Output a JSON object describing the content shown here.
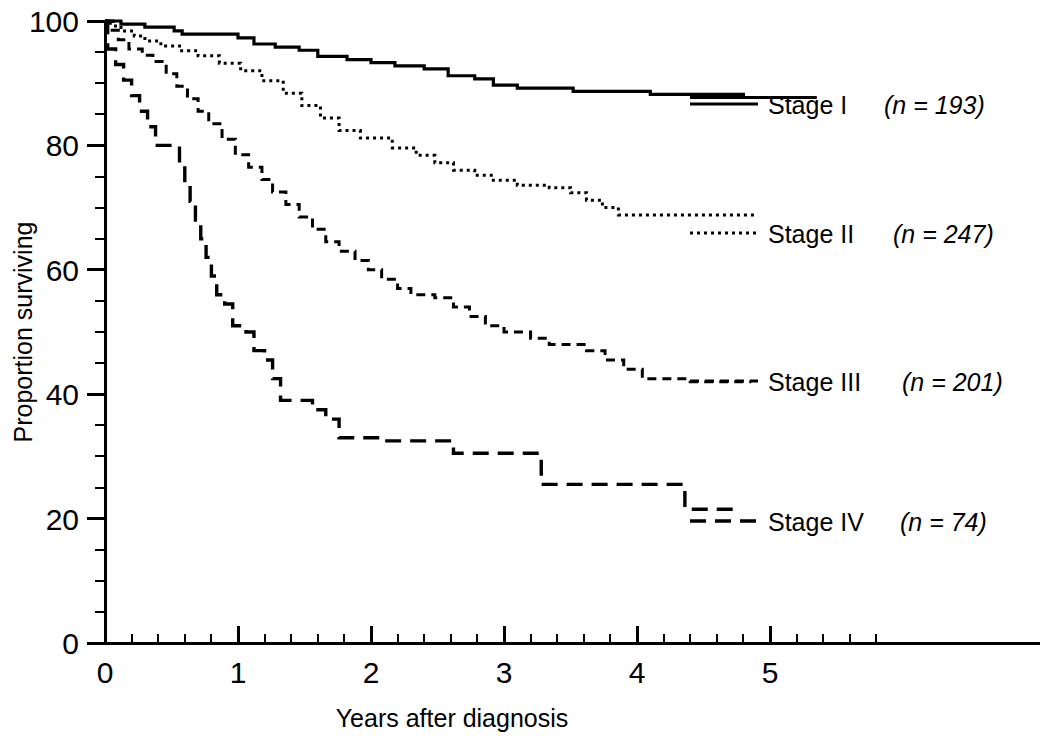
{
  "chart_data": {
    "type": "line",
    "title": "",
    "subtitle": "",
    "xlabel": "Years after diagnosis",
    "ylabel": "Proportion surviving",
    "xlim": [
      0,
      6.1
    ],
    "ylim": [
      0,
      101
    ],
    "x_ticks": [
      0,
      1,
      2,
      3,
      4,
      5
    ],
    "x_tick_labels": [
      "0",
      "1",
      "2",
      "3",
      "4",
      "5"
    ],
    "x_minor_step": 0.2,
    "y_ticks": [
      0,
      20,
      40,
      60,
      80,
      100
    ],
    "y_tick_labels": [
      "0",
      "20",
      "40",
      "60",
      "80",
      "100"
    ],
    "y_minor_step": 5,
    "grid": false,
    "legend_position": "right-inline",
    "series": [
      {
        "name": "Stage I",
        "n": 193,
        "label": "Stage I",
        "n_text": "(n = 193)",
        "linestyle": "solid",
        "dasharray": "none",
        "color": "#000000",
        "steps": [
          [
            0.0,
            100.0
          ],
          [
            0.12,
            100.0
          ],
          [
            0.12,
            99.5
          ],
          [
            0.3,
            99.5
          ],
          [
            0.3,
            99.0
          ],
          [
            0.52,
            99.0
          ],
          [
            0.52,
            98.4
          ],
          [
            0.58,
            98.4
          ],
          [
            0.58,
            97.9
          ],
          [
            1.0,
            97.9
          ],
          [
            1.0,
            97.3
          ],
          [
            1.12,
            97.3
          ],
          [
            1.12,
            96.3
          ],
          [
            1.28,
            96.3
          ],
          [
            1.28,
            95.8
          ],
          [
            1.46,
            95.8
          ],
          [
            1.46,
            95.3
          ],
          [
            1.6,
            95.3
          ],
          [
            1.6,
            94.3
          ],
          [
            1.82,
            94.3
          ],
          [
            1.82,
            93.8
          ],
          [
            2.0,
            93.8
          ],
          [
            2.0,
            93.3
          ],
          [
            2.18,
            93.3
          ],
          [
            2.18,
            92.8
          ],
          [
            2.4,
            92.8
          ],
          [
            2.4,
            92.3
          ],
          [
            2.58,
            92.3
          ],
          [
            2.58,
            91.2
          ],
          [
            2.78,
            91.2
          ],
          [
            2.78,
            90.7
          ],
          [
            2.92,
            90.7
          ],
          [
            2.92,
            89.7
          ],
          [
            3.1,
            89.7
          ],
          [
            3.1,
            89.2
          ],
          [
            3.52,
            89.2
          ],
          [
            3.52,
            88.7
          ],
          [
            4.1,
            88.7
          ],
          [
            4.1,
            88.2
          ],
          [
            4.8,
            88.2
          ],
          [
            4.8,
            87.7
          ],
          [
            5.35,
            87.7
          ]
        ]
      },
      {
        "name": "Stage II",
        "n": 247,
        "label": "Stage II",
        "n_text": "(n = 247)",
        "linestyle": "dotted",
        "dasharray": "3,4",
        "color": "#000000",
        "steps": [
          [
            0.0,
            100.0
          ],
          [
            0.06,
            100.0
          ],
          [
            0.06,
            99.2
          ],
          [
            0.12,
            99.2
          ],
          [
            0.12,
            98.4
          ],
          [
            0.22,
            98.4
          ],
          [
            0.22,
            97.6
          ],
          [
            0.3,
            97.6
          ],
          [
            0.3,
            96.8
          ],
          [
            0.42,
            96.8
          ],
          [
            0.42,
            96.0
          ],
          [
            0.56,
            96.0
          ],
          [
            0.56,
            95.2
          ],
          [
            0.7,
            95.2
          ],
          [
            0.7,
            94.4
          ],
          [
            0.86,
            94.4
          ],
          [
            0.86,
            93.2
          ],
          [
            1.02,
            93.2
          ],
          [
            1.02,
            92.0
          ],
          [
            1.18,
            92.0
          ],
          [
            1.18,
            90.4
          ],
          [
            1.34,
            90.4
          ],
          [
            1.34,
            88.4
          ],
          [
            1.48,
            88.4
          ],
          [
            1.48,
            86.4
          ],
          [
            1.62,
            86.4
          ],
          [
            1.62,
            84.4
          ],
          [
            1.76,
            84.4
          ],
          [
            1.76,
            82.4
          ],
          [
            1.92,
            82.4
          ],
          [
            1.92,
            81.2
          ],
          [
            2.16,
            81.2
          ],
          [
            2.16,
            79.6
          ],
          [
            2.34,
            79.6
          ],
          [
            2.34,
            78.4
          ],
          [
            2.48,
            78.4
          ],
          [
            2.48,
            77.2
          ],
          [
            2.62,
            77.2
          ],
          [
            2.62,
            76.0
          ],
          [
            2.78,
            76.0
          ],
          [
            2.78,
            75.2
          ],
          [
            2.92,
            75.2
          ],
          [
            2.92,
            74.4
          ],
          [
            3.1,
            74.4
          ],
          [
            3.1,
            73.6
          ],
          [
            3.34,
            73.6
          ],
          [
            3.34,
            73.2
          ],
          [
            3.5,
            73.2
          ],
          [
            3.5,
            72.4
          ],
          [
            3.62,
            72.4
          ],
          [
            3.62,
            71.2
          ],
          [
            3.74,
            71.2
          ],
          [
            3.74,
            70.0
          ],
          [
            3.86,
            70.0
          ],
          [
            3.86,
            68.8
          ],
          [
            4.88,
            68.8
          ]
        ]
      },
      {
        "name": "Stage III",
        "n": 201,
        "label": "Stage III",
        "n_text": "(n = 201)",
        "linestyle": "dashed-short",
        "dasharray": "9,6",
        "color": "#000000",
        "steps": [
          [
            0.0,
            100.0
          ],
          [
            0.04,
            100.0
          ],
          [
            0.04,
            98.5
          ],
          [
            0.1,
            98.5
          ],
          [
            0.1,
            97.0
          ],
          [
            0.18,
            97.0
          ],
          [
            0.18,
            95.5
          ],
          [
            0.28,
            95.5
          ],
          [
            0.28,
            94.5
          ],
          [
            0.36,
            94.5
          ],
          [
            0.36,
            93.5
          ],
          [
            0.46,
            93.5
          ],
          [
            0.46,
            91.5
          ],
          [
            0.54,
            91.5
          ],
          [
            0.54,
            89.5
          ],
          [
            0.62,
            89.5
          ],
          [
            0.62,
            87.5
          ],
          [
            0.7,
            87.5
          ],
          [
            0.7,
            85.5
          ],
          [
            0.78,
            85.5
          ],
          [
            0.78,
            83.5
          ],
          [
            0.88,
            83.5
          ],
          [
            0.88,
            81.0
          ],
          [
            0.98,
            81.0
          ],
          [
            0.98,
            78.5
          ],
          [
            1.08,
            78.5
          ],
          [
            1.08,
            76.5
          ],
          [
            1.18,
            76.5
          ],
          [
            1.18,
            74.5
          ],
          [
            1.26,
            74.5
          ],
          [
            1.26,
            72.5
          ],
          [
            1.36,
            72.5
          ],
          [
            1.36,
            70.5
          ],
          [
            1.46,
            70.5
          ],
          [
            1.46,
            68.5
          ],
          [
            1.56,
            68.5
          ],
          [
            1.56,
            66.5
          ],
          [
            1.66,
            66.5
          ],
          [
            1.66,
            64.5
          ],
          [
            1.76,
            64.5
          ],
          [
            1.76,
            63.0
          ],
          [
            1.88,
            63.0
          ],
          [
            1.88,
            61.5
          ],
          [
            1.98,
            61.5
          ],
          [
            1.98,
            60.0
          ],
          [
            2.08,
            60.0
          ],
          [
            2.08,
            58.5
          ],
          [
            2.2,
            58.5
          ],
          [
            2.2,
            57.0
          ],
          [
            2.3,
            57.0
          ],
          [
            2.3,
            56.0
          ],
          [
            2.48,
            56.0
          ],
          [
            2.48,
            55.5
          ],
          [
            2.62,
            55.5
          ],
          [
            2.62,
            54.0
          ],
          [
            2.74,
            54.0
          ],
          [
            2.74,
            52.5
          ],
          [
            2.86,
            52.5
          ],
          [
            2.86,
            51.0
          ],
          [
            3.0,
            51.0
          ],
          [
            3.0,
            50.0
          ],
          [
            3.2,
            50.0
          ],
          [
            3.2,
            49.0
          ],
          [
            3.34,
            49.0
          ],
          [
            3.34,
            48.0
          ],
          [
            3.62,
            48.0
          ],
          [
            3.62,
            47.0
          ],
          [
            3.76,
            47.0
          ],
          [
            3.76,
            45.5
          ],
          [
            3.9,
            45.5
          ],
          [
            3.9,
            44.0
          ],
          [
            4.04,
            44.0
          ],
          [
            4.04,
            42.5
          ],
          [
            4.4,
            42.5
          ],
          [
            4.4,
            42.0
          ],
          [
            4.86,
            42.0
          ]
        ]
      },
      {
        "name": "Stage IV",
        "n": 74,
        "label": "Stage IV",
        "n_text": "(n = 74)",
        "linestyle": "dashed-long",
        "dasharray": "16,9",
        "color": "#000000",
        "steps": [
          [
            0.0,
            100.0
          ],
          [
            0.02,
            100.0
          ],
          [
            0.02,
            95.5
          ],
          [
            0.08,
            95.5
          ],
          [
            0.08,
            93.0
          ],
          [
            0.14,
            93.0
          ],
          [
            0.14,
            90.5
          ],
          [
            0.2,
            90.5
          ],
          [
            0.2,
            88.0
          ],
          [
            0.26,
            88.0
          ],
          [
            0.26,
            85.5
          ],
          [
            0.32,
            85.5
          ],
          [
            0.32,
            83.0
          ],
          [
            0.38,
            83.0
          ],
          [
            0.38,
            80.0
          ],
          [
            0.56,
            80.0
          ],
          [
            0.56,
            77.0
          ],
          [
            0.6,
            77.0
          ],
          [
            0.6,
            74.0
          ],
          [
            0.64,
            74.0
          ],
          [
            0.64,
            71.0
          ],
          [
            0.68,
            71.0
          ],
          [
            0.68,
            68.0
          ],
          [
            0.72,
            68.0
          ],
          [
            0.72,
            65.0
          ],
          [
            0.76,
            65.0
          ],
          [
            0.76,
            62.0
          ],
          [
            0.8,
            62.0
          ],
          [
            0.8,
            59.0
          ],
          [
            0.84,
            59.0
          ],
          [
            0.84,
            56.0
          ],
          [
            0.9,
            56.0
          ],
          [
            0.9,
            54.5
          ],
          [
            0.96,
            54.5
          ],
          [
            0.96,
            51.0
          ],
          [
            1.06,
            51.0
          ],
          [
            1.06,
            50.0
          ],
          [
            1.12,
            50.0
          ],
          [
            1.12,
            47.0
          ],
          [
            1.2,
            47.0
          ],
          [
            1.2,
            45.5
          ],
          [
            1.26,
            45.5
          ],
          [
            1.26,
            42.5
          ],
          [
            1.32,
            42.5
          ],
          [
            1.32,
            39.0
          ],
          [
            1.56,
            39.0
          ],
          [
            1.56,
            37.5
          ],
          [
            1.66,
            37.5
          ],
          [
            1.66,
            36.0
          ],
          [
            1.76,
            36.0
          ],
          [
            1.76,
            33.0
          ],
          [
            2.1,
            33.0
          ],
          [
            2.1,
            32.5
          ],
          [
            2.62,
            32.5
          ],
          [
            2.62,
            30.5
          ],
          [
            3.28,
            30.5
          ],
          [
            3.28,
            25.5
          ],
          [
            4.36,
            25.5
          ],
          [
            4.36,
            21.5
          ],
          [
            4.78,
            21.5
          ]
        ]
      }
    ],
    "legend_entries": [
      {
        "label": "Stage I",
        "n_text": "(n = 193)"
      },
      {
        "label": "Stage II",
        "n_text": "(n = 247)"
      },
      {
        "label": "Stage III",
        "n_text": "(n = 201)"
      },
      {
        "label": "Stage IV",
        "n_text": "(n = 74)"
      }
    ]
  },
  "axes": {
    "y_labels": {
      "t0": "0",
      "t20": "20",
      "t40": "40",
      "t60": "60",
      "t80": "80",
      "t100": "100"
    },
    "x_labels": {
      "t0": "0",
      "t1": "1",
      "t2": "2",
      "t3": "3",
      "t4": "4",
      "t5": "5"
    },
    "x_title": "Years after diagnosis",
    "y_title": "Proportion surviving"
  },
  "legend": {
    "stage1": {
      "label": "Stage I",
      "n_text": "(n = 193)"
    },
    "stage2": {
      "label": "Stage II",
      "n_text": "(n = 247)"
    },
    "stage3": {
      "label": "Stage III",
      "n_text": "(n = 201)"
    },
    "stage4": {
      "label": "Stage IV",
      "n_text": "(n = 74)"
    }
  }
}
